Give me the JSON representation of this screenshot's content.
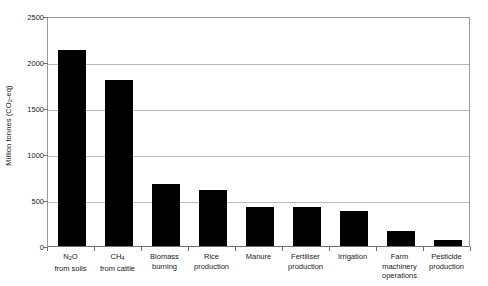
{
  "chart_data": {
    "type": "bar",
    "title": "",
    "xlabel": "",
    "ylabel": "Million tonnes (CO2-eq)",
    "ylabel_parts": {
      "prefix": "Million tonnes (CO",
      "subscript": "2",
      "suffix": "-eq)"
    },
    "ylim": [
      0,
      2500
    ],
    "ytick_values": [
      2500,
      2000,
      1500,
      1000,
      500,
      0
    ],
    "ytick_labels": [
      "2500",
      "2000",
      "1500",
      "1000",
      "500",
      "0"
    ],
    "grid": true,
    "grid_axis": "y",
    "legend": "none",
    "bar_color": "#000000",
    "categories": [
      "N2O from soils",
      "CH4 from cattle",
      "Biomass burning",
      "Rice production",
      "Manure",
      "Fertiliser production",
      "Irrigation",
      "Farm machinery operations",
      "Pesticide production"
    ],
    "category_label_lines": [
      [
        "N",
        "2",
        "O",
        "from soils"
      ],
      [
        "CH",
        "4",
        "",
        "from cattle"
      ],
      [
        "Biomass",
        "burning"
      ],
      [
        "Rice",
        "production"
      ],
      [
        "Manure"
      ],
      [
        "Fertiliser",
        "production"
      ],
      [
        "Irrigation"
      ],
      [
        "Farm",
        "machinery",
        "operations"
      ],
      [
        "Pesticide",
        "production"
      ]
    ],
    "values": [
      2130,
      1800,
      670,
      610,
      420,
      420,
      380,
      160,
      65
    ]
  }
}
